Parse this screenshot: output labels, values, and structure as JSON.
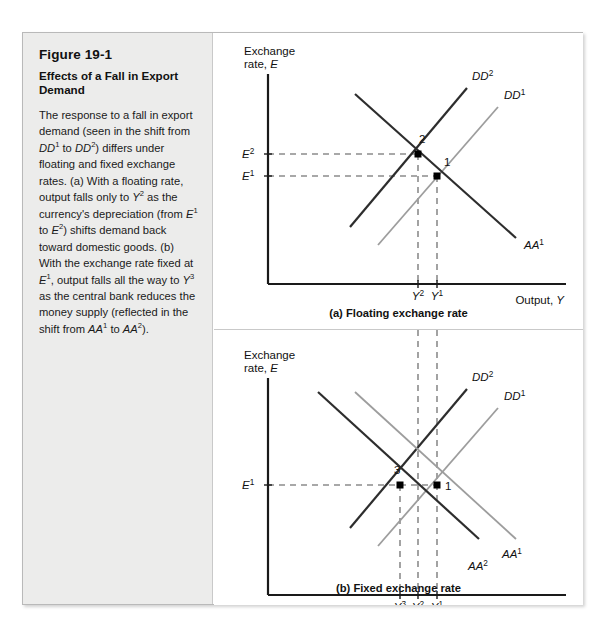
{
  "figure": {
    "number": "Figure 19-1",
    "title": "Effects of a Fall in Export Demand",
    "caption_runs": [
      {
        "t": "The response to a fall in export demand (seen in the shift from ",
        "i": false
      },
      {
        "t": "DD",
        "i": true
      },
      {
        "t": "1",
        "sup": true
      },
      {
        "t": " to ",
        "i": false
      },
      {
        "t": "DD",
        "i": true
      },
      {
        "t": "2",
        "sup": true
      },
      {
        "t": ") differs under floating and fixed exchange rates. (a) With a floating rate, output falls only to ",
        "i": false
      },
      {
        "t": "Y",
        "i": true
      },
      {
        "t": "2",
        "sup": true
      },
      {
        "t": " as the currency's depreciation (from ",
        "i": false
      },
      {
        "t": "E",
        "i": true
      },
      {
        "t": "1",
        "sup": true
      },
      {
        "t": " to ",
        "i": false
      },
      {
        "t": "E",
        "i": true
      },
      {
        "t": "2",
        "sup": true
      },
      {
        "t": ") shifts demand back toward domestic goods. (b) With the exchange rate fixed at ",
        "i": false
      },
      {
        "t": "E",
        "i": true
      },
      {
        "t": "1",
        "sup": true
      },
      {
        "t": ", output falls all the way to ",
        "i": false
      },
      {
        "t": "Y",
        "i": true
      },
      {
        "t": "3",
        "sup": true
      },
      {
        "t": " as the central bank reduces the money supply (reflected in the shift from ",
        "i": false
      },
      {
        "t": "AA",
        "i": true
      },
      {
        "t": "1",
        "sup": true
      },
      {
        "t": " to ",
        "i": false
      },
      {
        "t": "AA",
        "i": true
      },
      {
        "t": "2",
        "sup": true
      },
      {
        "t": ").",
        "i": false
      }
    ]
  },
  "colors": {
    "dark_curve": "#2d2d2d",
    "light_curve": "#9d9d9d",
    "dashed": "#8c8c8c",
    "axis": "#1a1a1a",
    "panel_bg": "#ececeb",
    "frame_border": "#b9b9b9"
  },
  "chart_data": [
    {
      "type": "line",
      "id": "panel-a",
      "title": "(a) Floating exchange rate",
      "ylabel_line1": "Exchange",
      "ylabel_line2": "rate, E",
      "xlabel": "Output, Y",
      "grid": false,
      "legend": "inline-curve-labels",
      "axis_origin": [
        54,
        251
      ],
      "axis_x_end": [
        352,
        251
      ],
      "axis_y_top": [
        54,
        41
      ],
      "curves": [
        {
          "name": "DD1",
          "label": "DD",
          "sup": "1",
          "style": "light",
          "x1": 164,
          "y1": 212,
          "x2": 284,
          "y2": 74,
          "label_x": 290,
          "label_y": 66
        },
        {
          "name": "DD2",
          "label": "DD",
          "sup": "2",
          "style": "dark",
          "x1": 136,
          "y1": 194,
          "x2": 253,
          "y2": 55,
          "label_x": 258,
          "label_y": 47
        },
        {
          "name": "AA1",
          "label": "AA",
          "sup": "1",
          "style": "dark",
          "x1": 141,
          "y1": 61,
          "x2": 302,
          "y2": 205,
          "label_x": 310,
          "label_y": 216
        }
      ],
      "points": [
        {
          "label": "1",
          "x": 223,
          "y": 143,
          "label_x": 230,
          "label_y": 133
        },
        {
          "label": "2",
          "x": 204,
          "y": 121,
          "label_x": 205,
          "label_y": 110
        }
      ],
      "y_ticks": [
        {
          "label": "E",
          "sup": "2",
          "y": 121,
          "label_x": 28
        },
        {
          "label": "E",
          "sup": "1",
          "y": 143,
          "label_x": 28
        }
      ],
      "x_ticks": [
        {
          "label": "Y",
          "sup": "2",
          "x": 204,
          "label_y": 267
        },
        {
          "label": "Y",
          "sup": "1",
          "x": 223,
          "label_y": 267
        }
      ],
      "dashed_h": [
        {
          "y": 121,
          "x1": 54,
          "x2": 204
        },
        {
          "y": 143,
          "x1": 54,
          "x2": 223
        }
      ],
      "dashed_v": [
        {
          "x": 204,
          "y1": 121,
          "y2": 251
        },
        {
          "x": 223,
          "y1": 143,
          "y2": 251
        }
      ]
    },
    {
      "type": "line",
      "id": "panel-b",
      "title": "(b) Fixed exchange rate",
      "ylabel_line1": "Exchange",
      "ylabel_line2": "rate, E",
      "xlabel": "Output, Y",
      "grid": false,
      "legend": "inline-curve-labels",
      "axis_origin": [
        54,
        265
      ],
      "axis_x_end": [
        352,
        265
      ],
      "axis_y_top": [
        54,
        48
      ],
      "curves": [
        {
          "name": "DD1",
          "label": "DD",
          "sup": "1",
          "style": "light",
          "x1": 164,
          "y1": 216,
          "x2": 284,
          "y2": 78,
          "label_x": 290,
          "label_y": 70
        },
        {
          "name": "DD2",
          "label": "DD",
          "sup": "2",
          "style": "dark",
          "x1": 136,
          "y1": 198,
          "x2": 253,
          "y2": 59,
          "label_x": 258,
          "label_y": 51
        },
        {
          "name": "AA1",
          "label": "AA",
          "sup": "1",
          "style": "light",
          "x1": 141,
          "y1": 62,
          "x2": 302,
          "y2": 209,
          "label_x": 288,
          "label_y": 228
        },
        {
          "name": "AA2",
          "label": "AA",
          "sup": "2",
          "style": "dark",
          "x1": 104,
          "y1": 62,
          "x2": 265,
          "y2": 209,
          "label_x": 254,
          "label_y": 240
        }
      ],
      "points": [
        {
          "label": "3",
          "x": 186,
          "y": 155,
          "label_x": 180,
          "label_y": 144
        },
        {
          "label": "1",
          "x": 223,
          "y": 155,
          "label_x": 231,
          "label_y": 160
        }
      ],
      "y_ticks": [
        {
          "label": "E",
          "sup": "1",
          "y": 155,
          "label_x": 28
        }
      ],
      "x_ticks": [
        {
          "label": "Y",
          "sup": "3",
          "x": 186,
          "label_y": 281
        },
        {
          "label": "Y",
          "sup": "2",
          "x": 204,
          "label_y": 281
        },
        {
          "label": "Y",
          "sup": "1",
          "x": 223,
          "label_y": 281
        }
      ],
      "dashed_h": [
        {
          "y": 155,
          "x1": 54,
          "x2": 223
        }
      ],
      "dashed_v": [
        {
          "x": 186,
          "y1": 155,
          "y2": 265
        },
        {
          "x": 204,
          "y1": -22,
          "y2": 265
        },
        {
          "x": 223,
          "y1": -22,
          "y2": 265
        }
      ]
    }
  ]
}
